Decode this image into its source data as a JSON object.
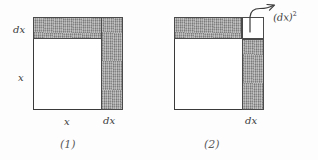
{
  "page": {
    "background_color": "#fdfdfd",
    "ink_color": "#3a3a3a",
    "shade_color": "#9b9b9b",
    "width": 318,
    "height": 160
  },
  "figures": [
    {
      "id": "1",
      "caption": "(1)",
      "square_side_label": "x",
      "description_labels": {
        "dx_left": "dx",
        "x_left": "x",
        "x_bottom": "x",
        "dx_bottom": "dx"
      },
      "shaded_regions": [
        {
          "name": "top-strip",
          "label": "dx"
        },
        {
          "name": "right-strip",
          "label": "dx"
        }
      ]
    },
    {
      "id": "2",
      "caption": "(2)",
      "description_labels": {
        "dx_bottom": "dx"
      },
      "annotation": {
        "base": "(dx)",
        "exponent": "2",
        "full": "(dx)²"
      },
      "shaded_regions": [
        {
          "name": "top-strip",
          "label": "dx"
        },
        {
          "name": "right-strip",
          "label": "dx"
        }
      ],
      "corner_square": {
        "name": "dx-squared-corner",
        "fill": "white"
      }
    }
  ]
}
